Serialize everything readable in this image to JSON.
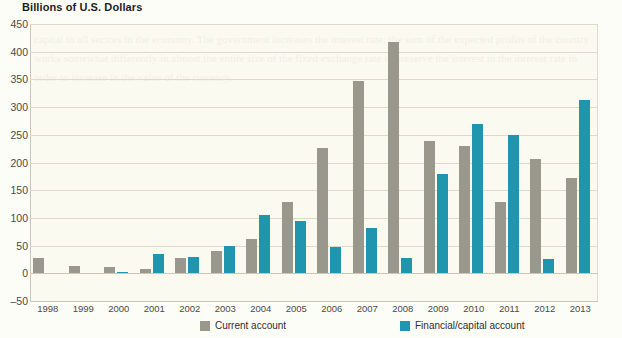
{
  "chart_data": {
    "type": "bar",
    "title": "Billions of U.S. Dollars",
    "xlabel": "",
    "ylabel": "Billions of U.S. Dollars",
    "ylim": [
      -50,
      450
    ],
    "yticks": [
      450,
      400,
      350,
      300,
      250,
      200,
      150,
      100,
      50,
      0,
      -50
    ],
    "grid": true,
    "legend_position": "bottom",
    "categories": [
      "1998",
      "1999",
      "2000",
      "2001",
      "2002",
      "2003",
      "2004",
      "2005",
      "2006",
      "2007",
      "2008",
      "2009",
      "2010",
      "2011",
      "2012",
      "2013"
    ],
    "series": [
      {
        "name": "Current account",
        "color": "#9a978c",
        "values": [
          27,
          13,
          12,
          8,
          27,
          40,
          62,
          128,
          227,
          348,
          418,
          238,
          230,
          128,
          207,
          172
        ]
      },
      {
        "name": "Financial/capital account",
        "color": "#1f96ae",
        "values": [
          0,
          0,
          3,
          35,
          30,
          50,
          105,
          95,
          47,
          82,
          27,
          180,
          270,
          250,
          25,
          312
        ]
      }
    ]
  },
  "legend": {
    "items": [
      {
        "label": "Current account",
        "color": "#9a978c"
      },
      {
        "label": "Financial/capital account",
        "color": "#1f96ae"
      }
    ]
  },
  "axes": {
    "y_tick_labels": [
      "450",
      "400",
      "350",
      "300",
      "250",
      "200",
      "150",
      "100",
      "50",
      "0",
      "–50"
    ],
    "x_tick_labels": [
      "1998",
      "1999",
      "2000",
      "2001",
      "2002",
      "2003",
      "2004",
      "2005",
      "2006",
      "2007",
      "2008",
      "2009",
      "2010",
      "2011",
      "2012",
      "2013"
    ]
  },
  "ghost": {
    "text": "capital to all sectors in the economy. The government increases the interest rate; the sum of the expected profits of the country works somewhat differently in almost the entire size of the fixed exchange rate to preserve the interest in the interest rate in order to increase in the value of the currency."
  }
}
